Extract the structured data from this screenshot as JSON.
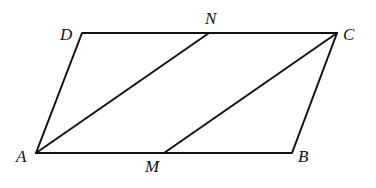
{
  "diagram": {
    "type": "geometry",
    "points": {
      "A": {
        "label": "A",
        "x": 36,
        "y": 153
      },
      "B": {
        "label": "B",
        "x": 292,
        "y": 153
      },
      "C": {
        "label": "C",
        "x": 337,
        "y": 33
      },
      "D": {
        "label": "D",
        "x": 82,
        "y": 33
      },
      "M": {
        "label": "M",
        "x": 164,
        "y": 153
      },
      "N": {
        "label": "N",
        "x": 209,
        "y": 33
      }
    },
    "segments": [
      "AB",
      "BC",
      "CD",
      "DA",
      "AN",
      "MC"
    ],
    "labels": {
      "A": "A",
      "B": "B",
      "C": "C",
      "D": "D",
      "M": "M",
      "N": "N"
    }
  }
}
